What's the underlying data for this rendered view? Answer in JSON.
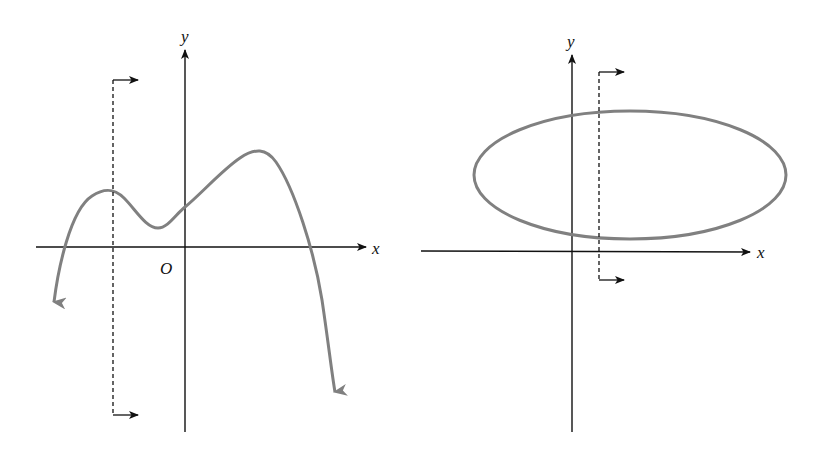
{
  "figure": {
    "left_panel": {
      "description": "Graph of a polynomial function with a vertical line test",
      "labels": {
        "y_axis": "y",
        "x_axis": "x",
        "origin": "O"
      },
      "curve": "quartic-like curve with two local maxima and one local minimum, both ends pointing down",
      "vertical_line": "dashed vertical line with right-pointing arrows at top and bottom",
      "colors": {
        "curve": "#808080",
        "axes": "#111111"
      }
    },
    "right_panel": {
      "description": "Ellipse with a vertical line test intersecting it twice",
      "labels": {
        "y_axis": "y",
        "x_axis": "x"
      },
      "curve": "horizontal ellipse above x-axis crossing y-axis",
      "vertical_line": "dashed vertical line with right-pointing arrows at top and bottom",
      "colors": {
        "curve": "#808080",
        "axes": "#111111"
      }
    }
  }
}
